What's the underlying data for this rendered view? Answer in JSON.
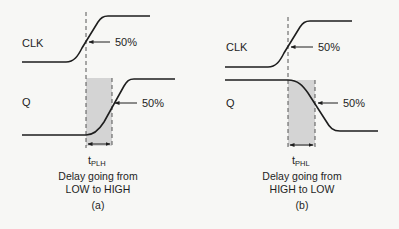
{
  "colors": {
    "background": "#f7f7f5",
    "ink": "#1e1e1e",
    "shade": "#d4d4d4",
    "dash": "#555555"
  },
  "panels": [
    {
      "id": "a",
      "clk_label": "CLK",
      "q_label": "Q",
      "clk_marker": "50%",
      "q_marker": "50%",
      "delay_symbol": "t",
      "delay_subscript": "PLH",
      "caption_line1": "Delay going from",
      "caption_line2": "LOW to HIGH",
      "panel_tag": "(a)",
      "q_transition": "low-to-high"
    },
    {
      "id": "b",
      "clk_label": "CLK",
      "q_label": "Q",
      "clk_marker": "50%",
      "q_marker": "50%",
      "delay_symbol": "t",
      "delay_subscript": "PHL",
      "caption_line1": "Delay going from",
      "caption_line2": "HIGH to LOW",
      "panel_tag": "(b)",
      "q_transition": "high-to-low"
    }
  ]
}
